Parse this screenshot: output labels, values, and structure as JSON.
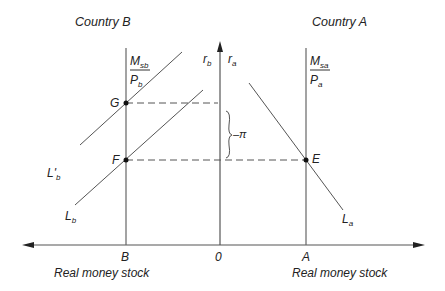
{
  "diagram": {
    "left_title": "Country B",
    "right_title": "Country A",
    "left_axis_caption": "Real money stock",
    "right_axis_caption": "Real money stock",
    "origin_label": "0",
    "point_B_label": "B",
    "point_A_label": "A",
    "axis_rb": {
      "main": "r",
      "sub": "b"
    },
    "axis_ra": {
      "main": "r",
      "sub": "a"
    },
    "supply_b": {
      "num_main": "M",
      "num_sub": "sb",
      "den_main": "P",
      "den_sub": "b"
    },
    "supply_a": {
      "num_main": "M",
      "num_sub": "sa",
      "den_main": "P",
      "den_sub": "a"
    },
    "points": {
      "G": "G",
      "F": "F",
      "E": "E"
    },
    "curves": {
      "Lb_prime": {
        "main": "L'",
        "sub": "b"
      },
      "Lb": {
        "main": "L",
        "sub": "b"
      },
      "La": {
        "main": "L",
        "sub": "a"
      }
    },
    "brace_label": "–π",
    "colors": {
      "line": "#555555",
      "text": "#222222",
      "dot": "#111111"
    }
  }
}
